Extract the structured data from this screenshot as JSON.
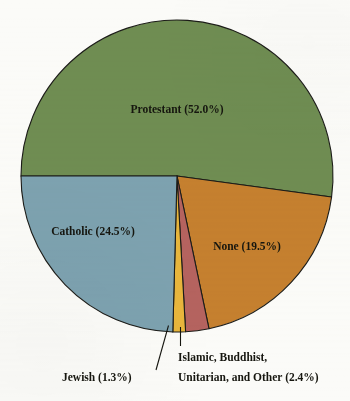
{
  "chart_data": {
    "type": "pie",
    "title": "",
    "subtitle": "",
    "xlabel": "",
    "ylabel": "",
    "legend_position": "none",
    "grid": false,
    "unit": "%",
    "start_angle_deg": 180,
    "direction": "clockwise",
    "categories": [
      "Protestant",
      "None",
      "Islamic, Buddhist, Unitarian, and Other",
      "Jewish",
      "Catholic"
    ],
    "values": [
      52.0,
      19.5,
      2.4,
      1.3,
      24.5
    ],
    "slices": [
      {
        "name": "Protestant",
        "value": 52.0,
        "label": "Protestant (52.0%)",
        "color": "#6f8d52",
        "label_placement": "inside",
        "label_x": 177,
        "label_y": 110
      },
      {
        "name": "None",
        "value": 19.5,
        "label": "None (19.5%)",
        "color": "#c5802f",
        "label_placement": "inside",
        "label_x": 247,
        "label_y": 247
      },
      {
        "name": "Islamic, Buddhist, Unitarian, and Other",
        "value": 2.4,
        "label_line_1": "Islamic, Buddhist,",
        "label_line_2": "Unitarian, and Other (2.4%)",
        "color": "#b5635f",
        "label_placement": "callout",
        "label_x": 178,
        "label_y": 357
      },
      {
        "name": "Jewish",
        "value": 1.3,
        "label": "Jewish (1.3%)",
        "color": "#e8b63c",
        "label_placement": "callout",
        "label_x": 62,
        "label_y": 380
      },
      {
        "name": "Catholic",
        "value": 24.5,
        "label": "Catholic (24.5%)",
        "color": "#7da2b0",
        "label_placement": "inside",
        "label_x": 93,
        "label_y": 232
      }
    ],
    "geometry": {
      "center_x": 177,
      "center_y": 176,
      "radius": 156
    },
    "colors": {
      "background": "#fbfbf8",
      "outline": "#1c1c18",
      "text": "#16160f",
      "leader_line": "#15150f"
    }
  }
}
